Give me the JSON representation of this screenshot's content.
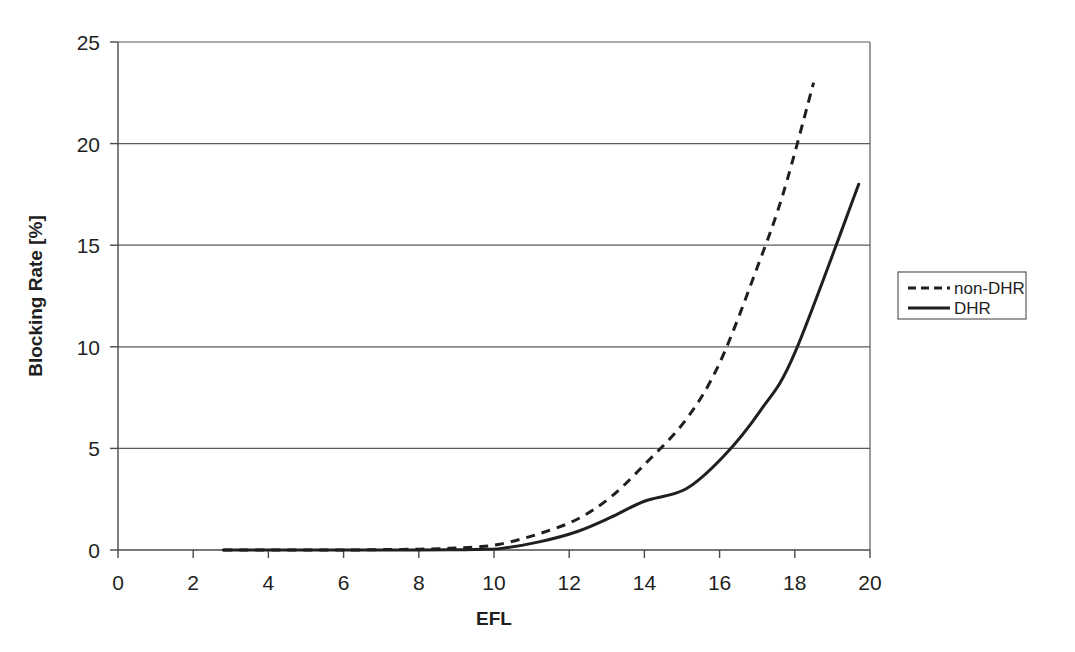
{
  "chart_data": {
    "type": "line",
    "title": "",
    "subtitle": "",
    "xlabel": "EFL",
    "ylabel": "Blocking Rate [%]",
    "xlim": [
      0,
      20
    ],
    "ylim": [
      0,
      25
    ],
    "xticks": [
      "0",
      "2",
      "4",
      "6",
      "8",
      "10",
      "12",
      "14",
      "16",
      "18",
      "20"
    ],
    "xtick_values": [
      0,
      2,
      4,
      6,
      8,
      10,
      12,
      14,
      16,
      18,
      20
    ],
    "yticks": [
      "0",
      "5",
      "10",
      "15",
      "20",
      "25"
    ],
    "ytick_values": [
      0,
      5,
      10,
      15,
      20,
      25
    ],
    "grid": "horizontal",
    "legend_position": "right-outside",
    "series": [
      {
        "name": "non-DHR",
        "style": "dashed",
        "color": "#1f1f1f",
        "marker": "diamond",
        "x": [
          2.8,
          3.3,
          3.9,
          4.5,
          5.1,
          5.7,
          6.3,
          7.1,
          8.0,
          8.8,
          9.5,
          10.2,
          11.2,
          12.2,
          13.1,
          14.0,
          15.1,
          16.0,
          17.0,
          17.7,
          18.5
        ],
        "y": [
          0.0,
          0.0,
          0.0,
          0.0,
          0.0,
          0.0,
          0.0,
          0.02,
          0.04,
          0.08,
          0.15,
          0.3,
          0.8,
          1.5,
          2.6,
          4.2,
          6.4,
          9.2,
          13.9,
          17.6,
          23.0
        ]
      },
      {
        "name": "DHR",
        "style": "solid",
        "color": "#1f1f1f",
        "marker": "diamond",
        "x": [
          2.8,
          3.3,
          3.9,
          4.5,
          5.1,
          5.7,
          6.3,
          7.1,
          8.0,
          8.8,
          9.5,
          10.2,
          11.2,
          12.2,
          13.1,
          14.0,
          15.1,
          16.1,
          17.1,
          18.0,
          19.7
        ],
        "y": [
          0.0,
          0.0,
          0.0,
          0.0,
          0.0,
          0.0,
          0.0,
          0.0,
          0.0,
          0.01,
          0.03,
          0.08,
          0.4,
          0.9,
          1.6,
          2.4,
          3.0,
          4.6,
          6.9,
          9.7,
          18.0
        ]
      }
    ],
    "legend_entries": [
      {
        "label": "non-DHR",
        "style": "dashed"
      },
      {
        "label": "DHR",
        "style": "solid"
      }
    ]
  },
  "axes": {
    "x_title": "EFL",
    "y_title": "Blocking Rate [%]",
    "x_tick_0": "0",
    "x_tick_1": "2",
    "x_tick_2": "4",
    "x_tick_3": "6",
    "x_tick_4": "8",
    "x_tick_5": "10",
    "x_tick_6": "12",
    "x_tick_7": "14",
    "x_tick_8": "16",
    "x_tick_9": "18",
    "x_tick_10": "20",
    "y_tick_0": "0",
    "y_tick_1": "5",
    "y_tick_2": "10",
    "y_tick_3": "15",
    "y_tick_4": "20",
    "y_tick_5": "25"
  },
  "legend": {
    "entry_0": "non-DHR",
    "entry_1": "DHR"
  },
  "colors": {
    "line": "#1f1f1f",
    "grid": "#5a5a5a",
    "axis": "#4a4a4a",
    "background": "#ffffff"
  }
}
